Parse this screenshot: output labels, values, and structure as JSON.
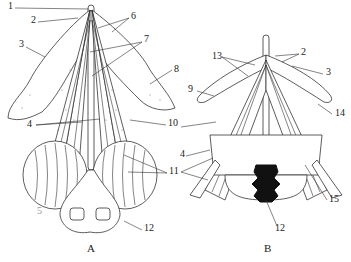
{
  "figure": {
    "panels": [
      {
        "id": "A",
        "label": "A",
        "callouts": [
          {
            "n": "1",
            "x": 8,
            "y": 5
          },
          {
            "n": "2",
            "x": 31,
            "y": 19
          },
          {
            "n": "3",
            "x": 19,
            "y": 43
          },
          {
            "n": "4",
            "x": 27,
            "y": 123
          },
          {
            "n": "5",
            "x": 37,
            "y": 210
          },
          {
            "n": "6",
            "x": 131,
            "y": 15
          },
          {
            "n": "7",
            "x": 144,
            "y": 38
          },
          {
            "n": "8",
            "x": 174,
            "y": 68
          },
          {
            "n": "10",
            "x": 168,
            "y": 122
          },
          {
            "n": "11",
            "x": 169,
            "y": 170
          },
          {
            "n": "12",
            "x": 144,
            "y": 227
          }
        ]
      },
      {
        "id": "B",
        "label": "B",
        "callouts": [
          {
            "n": "2",
            "x": 301,
            "y": 51
          },
          {
            "n": "3",
            "x": 326,
            "y": 71
          },
          {
            "n": "4",
            "x": 180,
            "y": 153
          },
          {
            "n": "9",
            "x": 188,
            "y": 88
          },
          {
            "n": "10",
            "x": 173,
            "y": 124
          },
          {
            "n": "11",
            "x": 173,
            "y": 170
          },
          {
            "n": "12",
            "x": 275,
            "y": 227
          },
          {
            "n": "13",
            "x": 212,
            "y": 55
          },
          {
            "n": "14",
            "x": 335,
            "y": 112
          },
          {
            "n": "15",
            "x": 329,
            "y": 198
          }
        ]
      }
    ],
    "panel_labels": {
      "A": {
        "x": 90,
        "y": 248,
        "text": "A"
      },
      "B": {
        "x": 267,
        "y": 248,
        "text": "B"
      }
    }
  }
}
